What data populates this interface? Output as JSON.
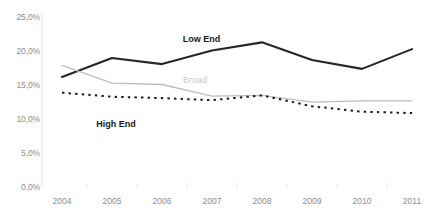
{
  "chart_data": {
    "type": "line",
    "title": "",
    "xlabel": "",
    "ylabel": "",
    "categories": [
      "2004",
      "2005",
      "2006",
      "2007",
      "2008",
      "2009",
      "2010",
      "2011"
    ],
    "ylim": [
      0,
      25
    ],
    "y_ticks": [
      "0,0%",
      "5,0%",
      "10,0%",
      "15,0%",
      "20,0%",
      "25,0%"
    ],
    "y_tick_values": [
      0,
      5,
      10,
      15,
      20,
      25
    ],
    "grid": false,
    "legend_position": "inline-annotations",
    "series": [
      {
        "name": "Low End",
        "values": [
          16.1,
          18.9,
          18.0,
          20.0,
          21.2,
          18.6,
          17.3,
          20.2
        ],
        "color": "#262626",
        "style": "solid",
        "width": 2.1
      },
      {
        "name": "Broad",
        "values": [
          17.8,
          15.2,
          15.0,
          13.3,
          13.4,
          12.4,
          12.6,
          12.6
        ],
        "color": "#bdbdbd",
        "style": "solid",
        "width": 1.3
      },
      {
        "name": "High End",
        "values": [
          13.8,
          13.2,
          13.0,
          12.7,
          13.4,
          11.8,
          11.0,
          10.8
        ],
        "color": "#1a1a1a",
        "style": "dotted",
        "width": 2.0
      }
    ],
    "annotations": [
      {
        "text": "Low End",
        "series": "Low End",
        "x_pct": 46.0,
        "y_pct": 15.5,
        "style": "bold-dark"
      },
      {
        "text": "Broad",
        "series": "Broad",
        "x_pct": 44.5,
        "y_pct": 34.0,
        "style": "gray"
      },
      {
        "text": "High End",
        "series": "High End",
        "x_pct": 26.5,
        "y_pct": 54.0,
        "style": "bold-dark"
      }
    ]
  },
  "axis": {
    "y_axis_color": "#e4e4e4",
    "tick_color": "#ededed"
  }
}
